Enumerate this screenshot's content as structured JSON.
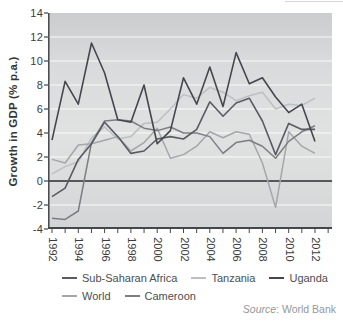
{
  "figure": {
    "y_axis_title": "Growth in GDP (% p.a.)",
    "source_word": "Source",
    "source_rest": ": World Bank"
  },
  "chart_data": {
    "type": "line",
    "title": "",
    "xlabel": "",
    "ylabel": "Growth in GDP (% p.a.)",
    "ylim": [
      -4,
      14
    ],
    "xlim": [
      1991.7,
      2013.3
    ],
    "grid": "horizontal white gridlines at even values",
    "legend_position": "bottom",
    "source": "Source: World Bank",
    "x": [
      1992,
      1993,
      1994,
      1995,
      1996,
      1997,
      1998,
      1999,
      2000,
      2001,
      2002,
      2003,
      2004,
      2005,
      2006,
      2007,
      2008,
      2009,
      2010,
      2011,
      2012
    ],
    "x_tick_labels": [
      "1992",
      "1994",
      "1996",
      "1998",
      "2000",
      "2002",
      "2004",
      "2006",
      "2008",
      "2010",
      "2012"
    ],
    "y_ticks": [
      14,
      12,
      10,
      8,
      6,
      4,
      2,
      0,
      -2,
      -4
    ],
    "series": [
      {
        "name": "Sub-Saharan Africa",
        "color": "#595c62",
        "values": [
          -1.3,
          -0.6,
          1.8,
          3.1,
          4.9,
          3.7,
          2.3,
          2.5,
          3.5,
          3.7,
          3.5,
          4.3,
          6.6,
          5.4,
          6.5,
          6.9,
          5.0,
          2.2,
          4.8,
          4.3,
          4.3
        ]
      },
      {
        "name": "Tanzania",
        "color": "#bdc0c2",
        "values": [
          0.6,
          1.2,
          1.6,
          3.6,
          4.5,
          3.5,
          3.7,
          4.8,
          4.9,
          6.0,
          7.2,
          6.9,
          7.8,
          7.4,
          6.7,
          7.1,
          7.4,
          6.0,
          6.4,
          6.3,
          6.9
        ]
      },
      {
        "name": "Uganda",
        "color": "#44474d",
        "values": [
          3.4,
          8.3,
          6.4,
          11.5,
          9.0,
          5.1,
          4.9,
          8.0,
          3.1,
          4.2,
          8.6,
          6.4,
          9.5,
          6.2,
          10.7,
          8.1,
          8.6,
          7.0,
          5.7,
          6.4,
          3.3
        ]
      },
      {
        "name": "World",
        "color": "#a4a7a9",
        "values": [
          1.8,
          1.5,
          3.0,
          3.1,
          3.4,
          3.7,
          2.5,
          3.2,
          4.4,
          1.9,
          2.2,
          2.9,
          4.1,
          3.6,
          4.1,
          3.9,
          1.5,
          -2.2,
          4.1,
          2.9,
          2.3
        ]
      },
      {
        "name": "Cameroon",
        "color": "#7b7e82",
        "values": [
          -3.1,
          -3.2,
          -2.5,
          3.2,
          5.0,
          5.1,
          5.0,
          4.4,
          4.2,
          4.5,
          4.0,
          4.0,
          3.7,
          2.3,
          3.2,
          3.4,
          2.9,
          1.9,
          3.3,
          4.1,
          4.6
        ]
      }
    ]
  }
}
